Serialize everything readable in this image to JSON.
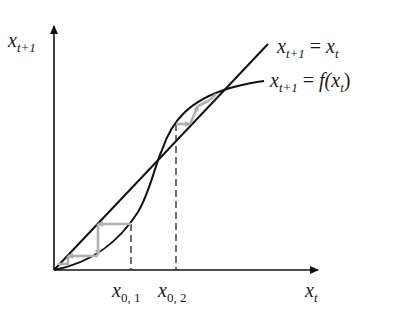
{
  "diagram": {
    "type": "cobweb-plot",
    "axes": {
      "y_label": {
        "base": "x",
        "sub": "t+1"
      },
      "x_label": {
        "base": "x",
        "sub": "t"
      }
    },
    "curves": [
      {
        "id": "identity",
        "label_lhs_base": "x",
        "label_lhs_sub": "t+1",
        "label_eq": " = ",
        "label_rhs_base": "x",
        "label_rhs_sub": "t"
      },
      {
        "id": "map",
        "label_lhs_base": "x",
        "label_lhs_sub": "t+1",
        "label_eq": " = ",
        "label_rhs_func": "f(",
        "label_rhs_base": "x",
        "label_rhs_sub": "t",
        "label_rhs_close": ")"
      }
    ],
    "initial_points": [
      {
        "base": "x",
        "sub": "0, 1"
      },
      {
        "base": "x",
        "sub": "0, 2"
      }
    ],
    "colors": {
      "axes": "#111111",
      "curves": "#111111",
      "cobweb": "#b0b0b0",
      "dashed": "#222222"
    }
  }
}
